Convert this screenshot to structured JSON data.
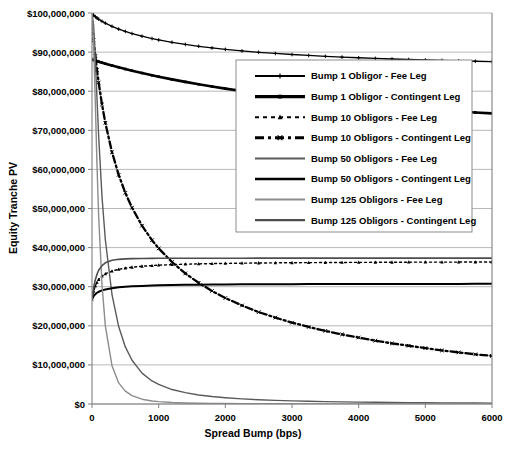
{
  "chart_data": {
    "type": "line",
    "title": "",
    "xlabel": "Spread Bump (bps)",
    "ylabel": "Equity Tranche PV",
    "xlim": [
      0,
      6000
    ],
    "ylim": [
      0,
      100000000
    ],
    "grid": true,
    "legend_position": "inside-upper-right",
    "x_ticks": [
      0,
      1000,
      2000,
      3000,
      4000,
      5000,
      6000
    ],
    "x_tick_labels": [
      "0",
      "1000",
      "2000",
      "3000",
      "4000",
      "5000",
      "6000"
    ],
    "y_ticks": [
      0,
      10000000,
      20000000,
      30000000,
      40000000,
      50000000,
      60000000,
      70000000,
      80000000,
      90000000,
      100000000
    ],
    "y_tick_labels": [
      "$0",
      "$10,000,000",
      "$20,000,000",
      "$30,000,000",
      "$40,000,000",
      "$50,000,000",
      "$60,000,000",
      "$70,000,000",
      "$80,000,000",
      "$90,000,000",
      "$100,000,000"
    ],
    "x": [
      0,
      25,
      50,
      75,
      100,
      150,
      200,
      300,
      400,
      500,
      600,
      750,
      900,
      1000,
      1200,
      1400,
      1600,
      1800,
      2000,
      2250,
      2500,
      2750,
      3000,
      3250,
      3500,
      3750,
      4000,
      4250,
      4500,
      4750,
      5000,
      5250,
      5500,
      5750,
      6000
    ],
    "series": [
      {
        "name": "Bump 1 Obligor - Fee Leg",
        "color": "#000000",
        "width": 1.3,
        "dash": "none",
        "marker": "plus",
        "values": [
          99800000,
          99400000,
          99050000,
          98720000,
          98420000,
          97880000,
          97400000,
          96580000,
          95880000,
          95280000,
          94750000,
          94060000,
          93470000,
          93120000,
          92500000,
          91960000,
          91490000,
          91070000,
          90700000,
          90300000,
          89950000,
          89650000,
          89380000,
          89140000,
          88920000,
          88730000,
          88550000,
          88390000,
          88240000,
          88110000,
          87980000,
          87870000,
          87760000,
          87660000,
          87570000
        ]
      },
      {
        "name": "Bump 1 Obligor - Contingent Leg",
        "color": "#000000",
        "width": 2.6,
        "dash": "none",
        "marker": "square",
        "values": [
          88100000,
          87960000,
          87820000,
          87680000,
          87550000,
          87290000,
          87040000,
          86560000,
          86100000,
          85660000,
          85240000,
          84640000,
          84070000,
          83710000,
          83020000,
          82380000,
          81770000,
          81200000,
          80660000,
          80030000,
          79450000,
          78900000,
          78400000,
          77930000,
          77490000,
          77080000,
          76690000,
          76330000,
          75990000,
          75670000,
          75370000,
          75080000,
          74810000,
          74560000,
          74320000
        ]
      },
      {
        "name": "Bump 10 Obligors - Fee Leg",
        "color": "#000000",
        "width": 1.4,
        "dash": "2,3",
        "marker": "triangle",
        "values": [
          26800000,
          28900000,
          30200000,
          31100000,
          31800000,
          32700000,
          33300000,
          34000000,
          34450000,
          34750000,
          34980000,
          35230000,
          35410000,
          35500000,
          35650000,
          35760000,
          35840000,
          35910000,
          35960000,
          36020000,
          36060000,
          36100000,
          36130000,
          36160000,
          36180000,
          36200000,
          36220000,
          36240000,
          36250000,
          36270000,
          36280000,
          36290000,
          36300000,
          36310000,
          36320000
        ]
      },
      {
        "name": "Bump 10 Obligors - Contingent Leg",
        "color": "#000000",
        "width": 2.3,
        "dash": "7,3,2,3",
        "marker": "x",
        "values": [
          97500000,
          93000000,
          89000000,
          85400000,
          82200000,
          76600000,
          71900000,
          64400000,
          58600000,
          54000000,
          50200000,
          45600000,
          41900000,
          39800000,
          36300000,
          33400000,
          31000000,
          28900000,
          27100000,
          25200000,
          23500000,
          22100000,
          20800000,
          19700000,
          18700000,
          17800000,
          17000000,
          16200000,
          15500000,
          14900000,
          14300000,
          13700000,
          13200000,
          12700000,
          12300000
        ]
      },
      {
        "name": "Bump 50 Obligors - Fee Leg",
        "color": "#5a5a5a",
        "width": 1.4,
        "dash": "none",
        "marker": "none",
        "values": [
          100000000,
          96500000,
          88000000,
          78000000,
          68500000,
          53000000,
          42000000,
          28000000,
          19800000,
          14600000,
          11200000,
          7900000,
          5900000,
          5000000,
          3700000,
          2900000,
          2300000,
          1900000,
          1600000,
          1300000,
          1080000,
          920000,
          790000,
          690000,
          610000,
          540000,
          480000,
          430000,
          390000,
          350000,
          320000,
          290000,
          270000,
          250000,
          230000
        ]
      },
      {
        "name": "Bump 50 Obligors - Contingent Leg",
        "color": "#000000",
        "width": 2.0,
        "dash": "none",
        "marker": "none",
        "values": [
          26800000,
          27600000,
          28100000,
          28450000,
          28700000,
          29050000,
          29300000,
          29620000,
          29830000,
          29980000,
          30090000,
          30210000,
          30300000,
          30340000,
          30420000,
          30470000,
          30510000,
          30540000,
          30570000,
          30600000,
          30620000,
          30640000,
          30650000,
          30660000,
          30670000,
          30680000,
          30690000,
          30700000,
          30700000,
          30710000,
          30710000,
          30720000,
          30720000,
          30730000,
          30730000
        ]
      },
      {
        "name": "Bump 125 Obligors - Fee Leg",
        "color": "#8c8c8c",
        "width": 1.4,
        "dash": "none",
        "marker": "none",
        "values": [
          100000000,
          92000000,
          77000000,
          61000000,
          48000000,
          30500000,
          20000000,
          9800000,
          5400000,
          3300000,
          2150000,
          1230000,
          780000,
          600000,
          390000,
          270000,
          200000,
          155000,
          120000,
          92000,
          72000,
          58000,
          48000,
          40000,
          34000,
          29000,
          25000,
          22000,
          19000,
          17000,
          15000,
          13500,
          12000,
          11000,
          10000
        ]
      },
      {
        "name": "Bump 125 Obligors - Contingent Leg",
        "color": "#4d4d4d",
        "width": 1.6,
        "dash": "none",
        "marker": "none",
        "values": [
          26800000,
          29800000,
          31800000,
          33200000,
          34200000,
          35400000,
          36100000,
          36750000,
          37000000,
          37120000,
          37180000,
          37230000,
          37250000,
          37260000,
          37270000,
          37280000,
          37280000,
          37290000,
          37290000,
          37290000,
          37300000,
          37300000,
          37300000,
          37300000,
          37300000,
          37300000,
          37300000,
          37300000,
          37300000,
          37300000,
          37300000,
          37300000,
          37300000,
          37300000,
          37300000
        ]
      }
    ]
  },
  "legend": {
    "items": [
      {
        "label": "Bump 1 Obligor - Fee Leg"
      },
      {
        "label": "Bump 1 Obligor - Contingent Leg"
      },
      {
        "label": "Bump 10 Obligors - Fee Leg"
      },
      {
        "label": "Bump 10 Obligors - Contingent Leg"
      },
      {
        "label": "Bump 50 Obligors - Fee Leg"
      },
      {
        "label": "Bump 50 Obligors - Contingent Leg"
      },
      {
        "label": "Bump 125 Obligors - Fee Leg"
      },
      {
        "label": "Bump 125 Obligors - Contingent Leg"
      }
    ]
  }
}
